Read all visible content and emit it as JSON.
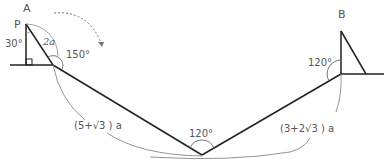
{
  "labels": {
    "point_a": "A",
    "point_p": "P",
    "point_b": "B",
    "angle_30": "30°",
    "angle_2a": "2a",
    "angle_150": "150°",
    "angle_120_b": "120°",
    "angle_120_bottom": "120°",
    "length_left": "(5+√3 ) a",
    "length_right": "(3+2√3 ) a"
  },
  "colors": {
    "line": "#222222",
    "arc": "#888888",
    "text": "#555555"
  }
}
